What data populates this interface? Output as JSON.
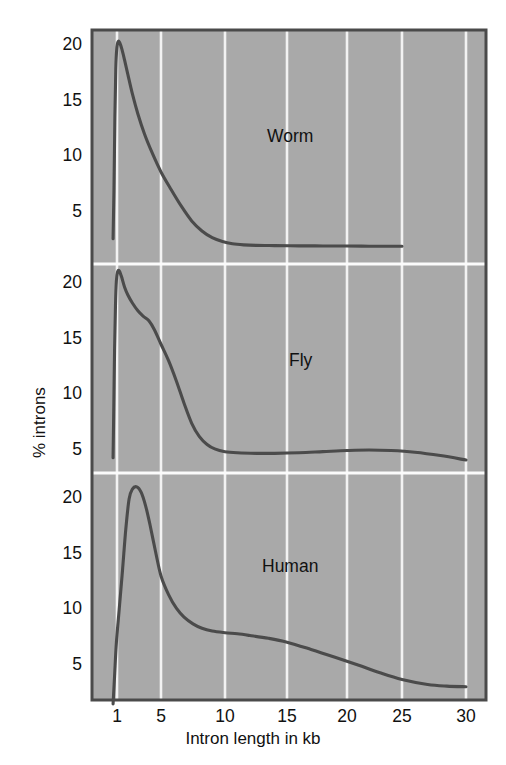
{
  "figure": {
    "background_color": "#ffffff",
    "plot_background_color": "#a9a9a9",
    "gridline_color": "#f2f2f2",
    "curve_color": "#4b4b4b",
    "border_color": "#4a4a4a",
    "text_color": "#111111"
  },
  "chart_data": {
    "type": "line",
    "title": "",
    "subtitle": "",
    "xlabel": "Intron length in kb",
    "ylabel": "% introns",
    "grid": true,
    "legend_position": "in-panel-annotation",
    "xlim": [
      0,
      31
    ],
    "x_tick_labels": [
      "1",
      "5",
      "10",
      "15",
      "20",
      "25",
      "30"
    ],
    "x_tick_values": [
      1,
      5,
      10,
      15,
      20,
      25,
      30
    ],
    "y_tick_labels": [
      "5",
      "10",
      "15",
      "20"
    ],
    "y_tick_values": [
      5,
      10,
      15,
      20
    ],
    "ylim": [
      0,
      23
    ],
    "panels": [
      {
        "name": "Worm",
        "annotation": "Worm",
        "x": [
          0.35,
          0.5,
          0.65,
          0.8,
          0.95,
          1.1,
          1.25,
          1.45,
          1.7,
          2.0,
          2.4,
          2.9,
          3.5,
          4.2,
          5.0,
          5.8,
          6.6,
          7.4,
          8.2,
          9.0,
          9.8,
          10.6,
          11.5,
          12.5,
          14.0,
          16.0,
          18.0,
          20.0,
          22.0,
          24.0,
          25.0
        ],
        "y": [
          2.6,
          7.0,
          13.5,
          17.8,
          19.6,
          20.3,
          20.2,
          19.6,
          18.6,
          17.3,
          15.6,
          13.8,
          12.0,
          10.3,
          8.6,
          7.0,
          5.5,
          4.2,
          3.3,
          2.7,
          2.35,
          2.15,
          2.05,
          2.0,
          1.98,
          1.96,
          1.95,
          1.94,
          1.93,
          1.92,
          1.92
        ]
      },
      {
        "name": "Fly",
        "annotation": "Fly",
        "x": [
          0.35,
          0.45,
          0.6,
          0.75,
          0.9,
          1.05,
          1.2,
          1.4,
          1.7,
          2.0,
          2.4,
          2.9,
          3.4,
          3.9,
          4.4,
          5.0,
          5.6,
          6.2,
          6.8,
          7.4,
          8.0,
          8.6,
          9.2,
          10.0,
          11.0,
          12.5,
          14.0,
          16.0,
          18.0,
          20.0,
          22.0,
          24.0,
          26.0,
          28.0,
          30.0
        ],
        "y": [
          4.3,
          8.0,
          14.0,
          18.0,
          20.2,
          21.0,
          21.1,
          20.6,
          19.6,
          18.9,
          18.2,
          17.5,
          17.0,
          16.6,
          15.8,
          14.5,
          13.0,
          11.2,
          9.2,
          7.4,
          6.2,
          5.5,
          5.1,
          4.85,
          4.75,
          4.7,
          4.7,
          4.75,
          4.85,
          4.95,
          5.0,
          4.95,
          4.8,
          4.5,
          4.1
        ]
      },
      {
        "name": "Human",
        "annotation": "Human",
        "x": [
          0.35,
          0.6,
          0.9,
          1.2,
          1.5,
          1.8,
          2.1,
          2.4,
          2.8,
          3.2,
          3.6,
          4.0,
          4.5,
          5.0,
          5.6,
          6.2,
          6.8,
          7.5,
          8.2,
          9.0,
          10.0,
          11.0,
          12.0,
          13.5,
          15.0,
          17.0,
          19.0,
          21.0,
          23.0,
          25.0,
          27.0,
          28.5,
          30.0
        ],
        "y": [
          1.5,
          4.0,
          7.0,
          10.0,
          13.5,
          17.2,
          19.9,
          20.8,
          21.0,
          20.5,
          19.3,
          17.6,
          15.2,
          13.0,
          11.3,
          10.1,
          9.3,
          8.7,
          8.3,
          8.05,
          7.9,
          7.8,
          7.65,
          7.4,
          7.05,
          6.4,
          5.7,
          5.0,
          4.3,
          3.7,
          3.25,
          3.1,
          3.05
        ]
      }
    ]
  }
}
